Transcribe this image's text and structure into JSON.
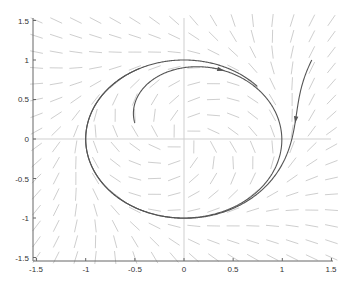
{
  "chart_data": {
    "type": "line",
    "title": "",
    "xlabel": "",
    "ylabel": "",
    "xlim": [
      -1.5,
      1.5
    ],
    "ylim": [
      -1.5,
      1.5
    ],
    "xticks": [
      -1.5,
      -1,
      -0.5,
      0,
      0.5,
      1,
      1.5
    ],
    "yticks": [
      -1.5,
      -1,
      -0.5,
      0,
      0.5,
      1,
      1.5
    ],
    "xtick_labels": [
      "-1.5",
      "-1",
      "-0.5",
      "0",
      "0.5",
      "1",
      "1.5"
    ],
    "ytick_labels": [
      "-1.5",
      "-1",
      "-0.5",
      "0",
      "0.5",
      "1",
      "1.5"
    ],
    "grid": false,
    "reference_lines": {
      "x0": true,
      "y0": true
    },
    "direction_field": {
      "description": "Short direction segments of dx/dt = y + x(1 - x^2 - y^2), dy/dt = -x + y(1 - x^2 - y^2)",
      "x_range": [
        -1.5,
        1.5
      ],
      "y_range": [
        -1.5,
        1.5
      ],
      "step": 0.2,
      "color": "#c8c8c8"
    },
    "series": [
      {
        "name": "trajectory-inside",
        "start": [
          -0.5,
          0.2
        ],
        "description": "Spirals outward clockwise toward the unit-circle limit cycle",
        "arrow_at_t": 1.6,
        "t_end": 7.0,
        "color": "#555555"
      },
      {
        "name": "trajectory-outside",
        "start": [
          1.3,
          1.0
        ],
        "description": "Spirals inward toward the unit-circle limit cycle",
        "arrow_at_t": 0.45,
        "t_end": 6.2,
        "color": "#555555"
      }
    ],
    "limit_cycle": {
      "shape": "circle",
      "radius": 1,
      "center": [
        0,
        0
      ]
    }
  },
  "axes": {
    "x_tick_labels": [
      "-1.5",
      "-1",
      "-0.5",
      "0",
      "0.5",
      "1",
      "1.5"
    ],
    "y_tick_labels": [
      "1.5",
      "1",
      "0.5",
      "0",
      "-0.5",
      "-1",
      "-1.5"
    ]
  }
}
